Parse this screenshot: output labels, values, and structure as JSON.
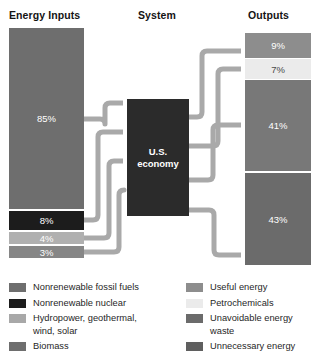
{
  "diagram": {
    "columns": {
      "inputs_title": "Energy Inputs",
      "system_title": "System",
      "outputs_title": "Outputs"
    },
    "system": {
      "line1": "U.S.",
      "line2": "economy"
    },
    "inputs": [
      {
        "key": "fossil",
        "value": "85%",
        "color": "#6e6e6e",
        "source": "Nonrenewable fossil fuels"
      },
      {
        "key": "nuclear",
        "value": "8%",
        "color": "#1c1c1c",
        "source": "Nonrenewable nuclear"
      },
      {
        "key": "renew",
        "value": "4%",
        "color": "#b0b0b0",
        "source": "Hydropower, geothermal, wind, solar"
      },
      {
        "key": "biomass",
        "value": "3%",
        "color": "#868686",
        "source": "Biomass"
      }
    ],
    "outputs": [
      {
        "key": "useful",
        "value": "9%",
        "color": "#8d8d8d",
        "source": "Useful energy"
      },
      {
        "key": "petro",
        "value": "7%",
        "color": "#ebebeb",
        "source": "Petrochemicals"
      },
      {
        "key": "unavoid",
        "value": "41%",
        "color": "#787878",
        "source": "Unavoidable energy waste"
      },
      {
        "key": "unnec",
        "value": "43%",
        "color": "#6b6b6b",
        "source": "Unnecessary energy"
      }
    ],
    "legend_left": [
      {
        "label": "Nonrenewable fossil fuels",
        "color": "#6e6e6e"
      },
      {
        "label": "Nonrenewable nuclear",
        "color": "#1c1c1c"
      },
      {
        "label": "Hydropower, geothermal,\nwind, solar",
        "color": "#a8a8a8"
      },
      {
        "label": "Biomass",
        "color": "#6e6e6e"
      }
    ],
    "legend_right": [
      {
        "label": "Useful energy",
        "color": "#8d8d8d"
      },
      {
        "label": "Petrochemicals",
        "color": "#ebebeb"
      },
      {
        "label": "Unavoidable energy\nwaste",
        "color": "#6b6b6b"
      },
      {
        "label": "Unnecessary energy",
        "color": "#5f5f5f"
      }
    ],
    "arrow_color": "#a9a9a9"
  }
}
